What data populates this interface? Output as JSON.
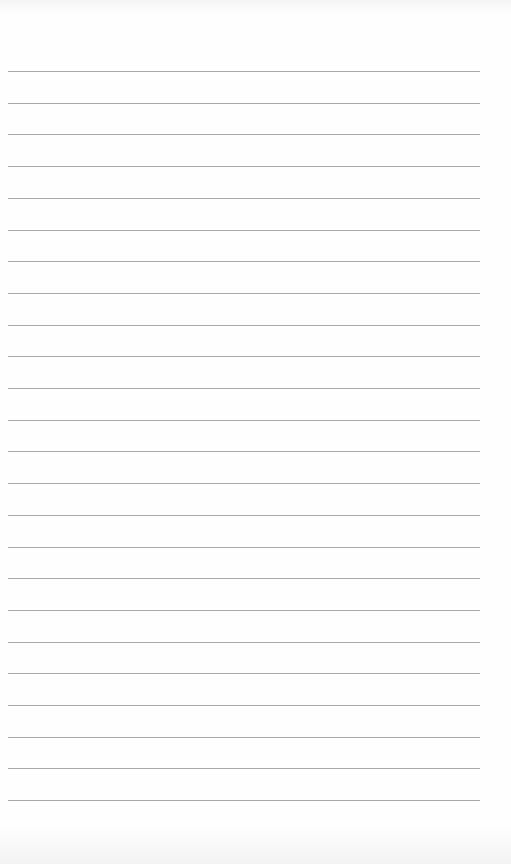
{
  "document": {
    "type": "lined-paper",
    "rule_count": 24,
    "rule_color": "#9a9a9a",
    "paper_color": "#fefefe",
    "text": []
  }
}
